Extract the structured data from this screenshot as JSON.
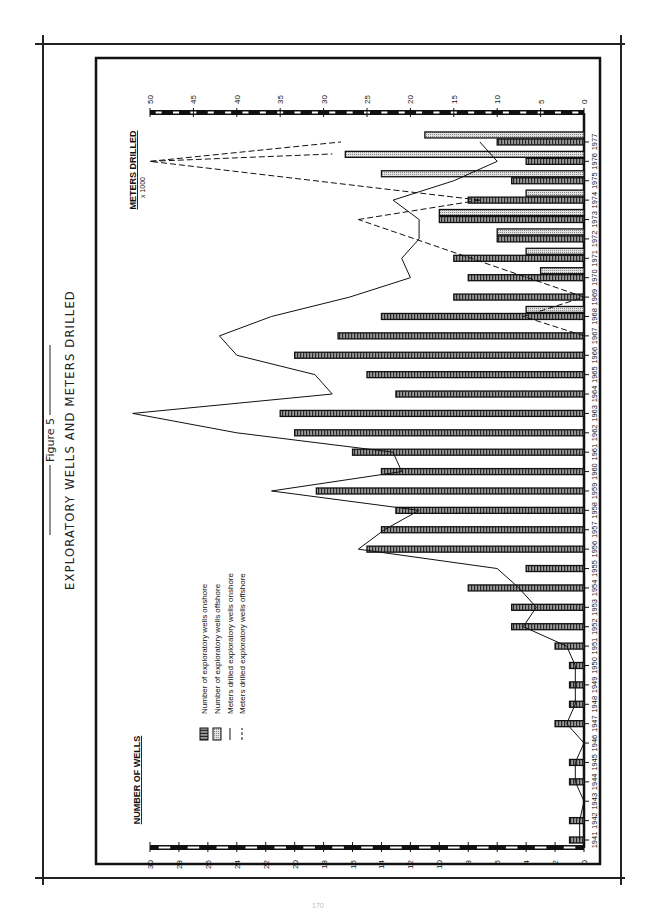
{
  "figure": {
    "label": "Figure 5",
    "title": "EXPLORATORY WELLS AND METERS DRILLED",
    "orientation": "rotated 90° counter-clockwise on page"
  },
  "axes": {
    "left_axis_title": "NUMBER OF WELLS",
    "right_axis_title": "METERS DRILLED",
    "right_axis_unit": "x 1000",
    "wells_ticks": [
      "30",
      "28",
      "26",
      "24",
      "22",
      "20",
      "18",
      "16",
      "14",
      "12",
      "10",
      "8",
      "6",
      "4",
      "2",
      "0"
    ],
    "meters_ticks": [
      "50",
      "45",
      "40",
      "35",
      "30",
      "25",
      "20",
      "15",
      "10",
      "5",
      "0"
    ]
  },
  "legend": {
    "items": [
      {
        "label": "Number of exploratory wells onshore",
        "symbol": "dark-hatched-bar"
      },
      {
        "label": "Number of exploratory wells offshore",
        "symbol": "light-dotted-bar"
      },
      {
        "label": "Meters drilled exploratory wells onshore",
        "symbol": "solid-line"
      },
      {
        "label": "Meters drilled exploratory wells offshore",
        "symbol": "dashed-line"
      }
    ]
  },
  "colors": {
    "ink": "#111111",
    "onshore_fill": "#6a6a6a",
    "offshore_fill": "#cfcfcf",
    "frame": "#222222"
  },
  "chart_data": {
    "type": "bar",
    "title": "EXPLORATORY WELLS AND METERS DRILLED",
    "subtitle": "Figure 5",
    "xlabel": "",
    "ylabel": "NUMBER OF WELLS",
    "y2label": "METERS DRILLED x 1000",
    "ylim": [
      0,
      30
    ],
    "y2lim": [
      0,
      50
    ],
    "grid": false,
    "legend_position": "upper-left (in unrotated view)",
    "categories": [
      "1941",
      "1942",
      "1943",
      "1944",
      "1945",
      "1946",
      "1947",
      "1948",
      "1949",
      "1950",
      "1951",
      "1952",
      "1953",
      "1954",
      "1955",
      "1956",
      "1957",
      "1958",
      "1959",
      "1960",
      "1961",
      "1962",
      "1963",
      "1964",
      "1965",
      "1966",
      "1967",
      "1968",
      "1969",
      "1970",
      "1971",
      "1972",
      "1973",
      "1974",
      "1975",
      "1976",
      "1977"
    ],
    "series": [
      {
        "name": "Number of exploratory wells onshore",
        "type": "bar",
        "axis": "left",
        "values": [
          1,
          1,
          0,
          1,
          1,
          0,
          2,
          1,
          1,
          1,
          2,
          5,
          5,
          8,
          4,
          15,
          14,
          13,
          18.5,
          14,
          16,
          20,
          21,
          13,
          15,
          20,
          17,
          14,
          9,
          8,
          9,
          6,
          10,
          8,
          5,
          4,
          6
        ]
      },
      {
        "name": "Number of exploratory wells offshore",
        "type": "bar",
        "axis": "left",
        "values": [
          0,
          0,
          0,
          0,
          0,
          0,
          0,
          0,
          0,
          0,
          0,
          0,
          0,
          0,
          0,
          0,
          0,
          0,
          0,
          0,
          0,
          0,
          0,
          0,
          0,
          0,
          0,
          4,
          0,
          3,
          4,
          6,
          10,
          4,
          14,
          16.5,
          11
        ]
      },
      {
        "name": "Meters drilled exploratory wells onshore",
        "type": "line",
        "axis": "right",
        "values": [
          0.5,
          0.5,
          0,
          1,
          1,
          0,
          2,
          1,
          1,
          1,
          2,
          7,
          5.5,
          7.5,
          10,
          26,
          23,
          19,
          36,
          21,
          22,
          40,
          52,
          29,
          31,
          40,
          42,
          36,
          27,
          20,
          21,
          19,
          19,
          22,
          15,
          10,
          12
        ]
      },
      {
        "name": "Meters drilled exploratory wells offshore",
        "type": "line",
        "axis": "right",
        "style": "dashed",
        "values": [
          null,
          null,
          null,
          null,
          null,
          null,
          null,
          null,
          null,
          null,
          null,
          null,
          null,
          null,
          null,
          null,
          null,
          null,
          null,
          null,
          null,
          null,
          null,
          null,
          null,
          null,
          0,
          7,
          0,
          null,
          null,
          null,
          26,
          12,
          null,
          50,
          28
        ]
      }
    ]
  },
  "page": {
    "number": "170"
  }
}
